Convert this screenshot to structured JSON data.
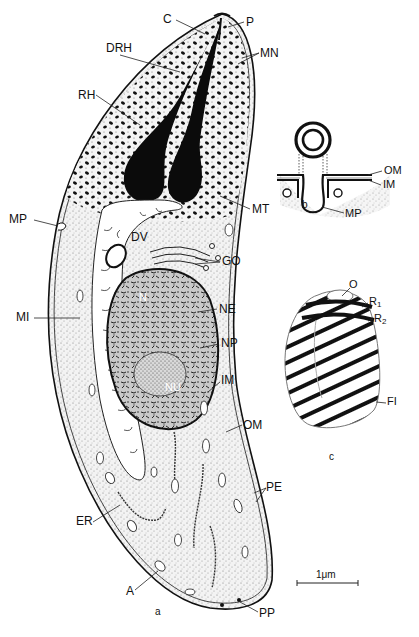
{
  "figure": {
    "panels": [
      {
        "id": "a",
        "label": "a",
        "description": "Longitudinal section of the zoite"
      },
      {
        "id": "b",
        "label": "b",
        "description": "Micropore in section"
      },
      {
        "id": "c",
        "label": "c",
        "description": "Conoid with polar rings"
      }
    ],
    "scale_bar": {
      "label": "1μm"
    }
  },
  "labels": {
    "panel_a": [
      {
        "key": "C",
        "text": "C",
        "x": 163,
        "y": 13
      },
      {
        "key": "P",
        "text": "P",
        "x": 246,
        "y": 16
      },
      {
        "key": "DRH",
        "text": "DRH",
        "x": 106,
        "y": 42
      },
      {
        "key": "MN",
        "text": "MN",
        "x": 260,
        "y": 47
      },
      {
        "key": "RH",
        "text": "RH",
        "x": 78,
        "y": 89
      },
      {
        "key": "MP",
        "text": "MP",
        "x": 9,
        "y": 213
      },
      {
        "key": "DV",
        "text": "DV",
        "x": 131,
        "y": 231
      },
      {
        "key": "MT",
        "text": "MT",
        "x": 252,
        "y": 203
      },
      {
        "key": "GO",
        "text": "GO",
        "x": 222,
        "y": 255
      },
      {
        "key": "MI",
        "text": "MI",
        "x": 16,
        "y": 311
      },
      {
        "key": "N",
        "text": "N",
        "x": 139,
        "y": 292
      },
      {
        "key": "NE",
        "text": "NE",
        "x": 219,
        "y": 303
      },
      {
        "key": "NP",
        "text": "NP",
        "x": 221,
        "y": 337
      },
      {
        "key": "NU",
        "text": "NU",
        "x": 165,
        "y": 382
      },
      {
        "key": "IM",
        "text": "IM",
        "x": 221,
        "y": 374
      },
      {
        "key": "OM",
        "text": "OM",
        "x": 243,
        "y": 419
      },
      {
        "key": "ER",
        "text": "ER",
        "x": 76,
        "y": 515
      },
      {
        "key": "PE",
        "text": "PE",
        "x": 266,
        "y": 481
      },
      {
        "key": "A",
        "text": "A",
        "x": 126,
        "y": 585
      },
      {
        "key": "PP",
        "text": "PP",
        "x": 259,
        "y": 607
      }
    ],
    "panel_b": [
      {
        "key": "OM",
        "text": "OM",
        "x": 384,
        "y": 165
      },
      {
        "key": "IM",
        "text": "IM",
        "x": 383,
        "y": 179
      },
      {
        "key": "MP",
        "text": "MP",
        "x": 345,
        "y": 208
      }
    ],
    "panel_c": [
      {
        "key": "O",
        "text": "O",
        "x": 349,
        "y": 279
      },
      {
        "key": "R1",
        "text": "R",
        "sub": "1",
        "x": 369,
        "y": 296
      },
      {
        "key": "R2",
        "text": "R",
        "sub": "2",
        "x": 374,
        "y": 313
      },
      {
        "key": "FI",
        "text": "FI",
        "x": 387,
        "y": 396
      }
    ]
  }
}
